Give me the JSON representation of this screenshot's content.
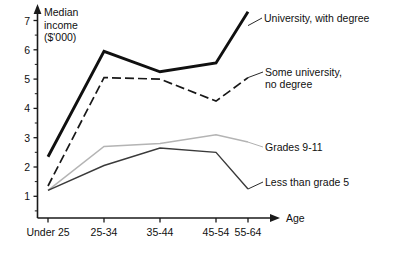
{
  "chart_data": {
    "type": "line",
    "title_lines": [
      "Median",
      "income",
      "($'000)"
    ],
    "xlabel": "Age",
    "ylabel": "Median income ($'000)",
    "categories": [
      "Under 25",
      "25-34",
      "35-44",
      "45-54",
      "55-64"
    ],
    "ylim": [
      0,
      7.6
    ],
    "yticks": [
      1,
      2,
      3,
      4,
      5,
      6,
      7
    ],
    "ytick_labels": [
      "1",
      "2",
      "3",
      "4",
      "5",
      "6",
      "7"
    ],
    "minor_ticks": true,
    "grid": false,
    "legend_position": "right-inline-labels",
    "series": [
      {
        "name": "University, with degree",
        "label_lines": [
          "University, with degree"
        ],
        "style": "thick-solid",
        "color": "#101010",
        "values": [
          2.35,
          5.95,
          5.25,
          5.55,
          7.3
        ]
      },
      {
        "name": "Some university, no degree",
        "label_lines": [
          "Some university,",
          "no degree"
        ],
        "style": "dashed",
        "color": "#181818",
        "values": [
          1.35,
          5.05,
          5.0,
          4.25,
          5.05
        ]
      },
      {
        "name": "Grades 9-11",
        "label_lines": [
          "Grades 9-11"
        ],
        "style": "thin-light",
        "color": "#b4b4b4",
        "values": [
          1.2,
          2.7,
          2.8,
          3.1,
          2.85
        ]
      },
      {
        "name": "Less than grade 5",
        "label_lines": [
          "Less than grade 5"
        ],
        "style": "thin-solid",
        "color": "#3a3a3a",
        "values": [
          1.2,
          2.05,
          2.65,
          2.5,
          1.25
        ]
      }
    ]
  },
  "axes": {
    "y_tick_0": "1",
    "y_tick_1": "2",
    "y_tick_2": "3",
    "y_tick_3": "4",
    "y_tick_4": "5",
    "y_tick_5": "6",
    "y_tick_6": "7",
    "x_tick_0": "Under 25",
    "x_tick_1": "25-34",
    "x_tick_2": "35-44",
    "x_tick_3": "45-54",
    "x_tick_4": "55-64",
    "x_axis_title": "Age"
  },
  "title": {
    "line1": "Median",
    "line2": "income",
    "line3": "($'000)"
  },
  "series_labels": {
    "university": "University, with degree",
    "someuni_line1": "Some university,",
    "someuni_line2": "no degree",
    "grades": "Grades 9-11",
    "lessgrade": "Less than grade 5"
  }
}
